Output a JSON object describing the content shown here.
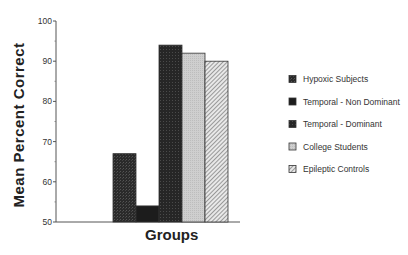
{
  "chart_data": {
    "type": "bar",
    "title": "",
    "xlabel": "Groups",
    "ylabel": "Mean Percent Correct",
    "ylim": [
      50,
      100
    ],
    "yticks": [
      50,
      60,
      70,
      80,
      90,
      100
    ],
    "grid": false,
    "legend_position": "right",
    "categories": [
      "Groups"
    ],
    "series": [
      {
        "name": "Hypoxic Subjects",
        "values": [
          67
        ],
        "color": "#2e2e2e",
        "pattern": "dark-stipple"
      },
      {
        "name": "Temporal - Non Dominant",
        "values": [
          54
        ],
        "color": "#1c1c1c",
        "pattern": "solid-dark"
      },
      {
        "name": "Temporal - Dominant",
        "values": [
          94
        ],
        "color": "#2a2a2a",
        "pattern": "dark-stipple"
      },
      {
        "name": "College Students",
        "values": [
          92
        ],
        "color": "#c8c8c8",
        "pattern": "light-gray"
      },
      {
        "name": "Epileptic Controls",
        "values": [
          90
        ],
        "color": "#b0b0b0",
        "pattern": "diagonal-hatch"
      }
    ]
  },
  "legend": {
    "items": [
      {
        "label": "Hypoxic Subjects"
      },
      {
        "label": "Temporal - Non Dominant"
      },
      {
        "label": "Temporal - Dominant"
      },
      {
        "label": "College Students"
      },
      {
        "label": "Epileptic Controls"
      }
    ]
  },
  "axis": {
    "xlabel": "Groups",
    "ylabel": "Mean Percent Correct",
    "ticks": [
      "100",
      "90",
      "80",
      "70",
      "60",
      "50"
    ]
  }
}
